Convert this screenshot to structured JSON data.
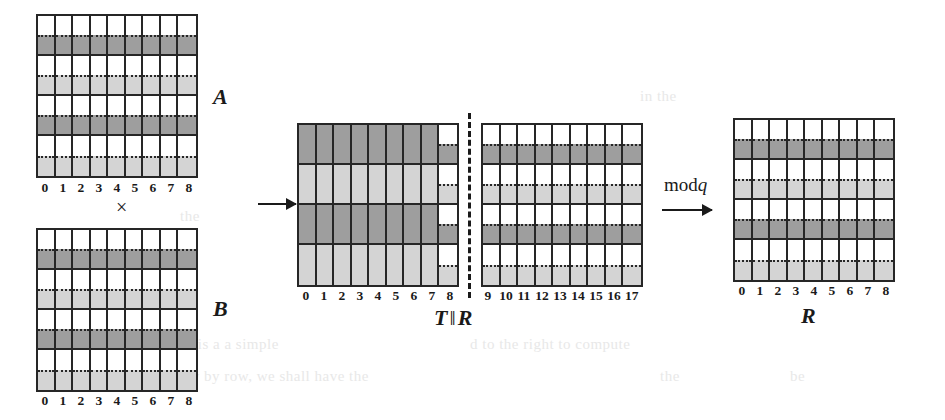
{
  "figure": {
    "type": "matrix-multiplication-diagram",
    "operator_symbol": "×",
    "arrow_glyph": "→",
    "mod_label": "mod",
    "mod_variable": "q",
    "concat_symbol": "‖"
  },
  "colors": {
    "dark_band": "#9e9e9e",
    "light_band": "#d4d4d4",
    "empty": "#ffffff",
    "grid_line": "#262626",
    "page_background": "#ffffff"
  },
  "blocks": {
    "a": {
      "label": "A",
      "columns": [
        "0",
        "1",
        "2",
        "3",
        "4",
        "5",
        "6",
        "7",
        "8"
      ],
      "rows": [
        {
          "style": "split",
          "fill": "dark"
        },
        {
          "style": "split",
          "fill": "light"
        },
        {
          "style": "split",
          "fill": "dark"
        },
        {
          "style": "split",
          "fill": "light"
        }
      ]
    },
    "b": {
      "label": "B",
      "columns": [
        "0",
        "1",
        "2",
        "3",
        "4",
        "5",
        "6",
        "7",
        "8"
      ],
      "rows": [
        {
          "style": "split",
          "fill": "dark"
        },
        {
          "style": "split",
          "fill": "light"
        },
        {
          "style": "split",
          "fill": "dark"
        },
        {
          "style": "split",
          "fill": "light"
        }
      ]
    },
    "t": {
      "label": "T",
      "columns": [
        "0",
        "1",
        "2",
        "3",
        "4",
        "5",
        "6",
        "7",
        "8"
      ],
      "rows": [
        {
          "style": "solid",
          "fill": "dark"
        },
        {
          "style": "solid",
          "fill": "light"
        },
        {
          "style": "solid",
          "fill": "dark"
        },
        {
          "style": "solid",
          "fill": "light"
        }
      ],
      "last_column_style": "split"
    },
    "r_mid": {
      "label": "R",
      "columns": [
        "9",
        "10",
        "11",
        "12",
        "13",
        "14",
        "15",
        "16",
        "17"
      ],
      "rows": [
        {
          "style": "split",
          "fill": "dark"
        },
        {
          "style": "split",
          "fill": "light"
        },
        {
          "style": "split",
          "fill": "dark"
        },
        {
          "style": "split",
          "fill": "light"
        }
      ]
    },
    "r_out": {
      "label": "R",
      "columns": [
        "0",
        "1",
        "2",
        "3",
        "4",
        "5",
        "6",
        "7",
        "8"
      ],
      "rows": [
        {
          "style": "split",
          "fill": "dark"
        },
        {
          "style": "split",
          "fill": "light"
        },
        {
          "style": "split",
          "fill": "dark"
        },
        {
          "style": "split",
          "fill": "light"
        }
      ]
    }
  },
  "captions": {
    "middle": "T ‖ R",
    "middle_left": "T",
    "middle_right": "R",
    "right": "R"
  },
  "ghost_text": [
    {
      "text": "in the",
      "x": 640,
      "y": 95
    },
    {
      "text": "the",
      "x": 180,
      "y": 215
    },
    {
      "text": "as is a a simple",
      "x": 180,
      "y": 343
    },
    {
      "text": "d to  the  right  to  compute",
      "x": 470,
      "y": 343
    },
    {
      "text": "row  by  row,  we  shall  have  the",
      "x": 175,
      "y": 375
    },
    {
      "text": "the",
      "x": 660,
      "y": 375
    },
    {
      "text": "be",
      "x": 790,
      "y": 375
    }
  ]
}
